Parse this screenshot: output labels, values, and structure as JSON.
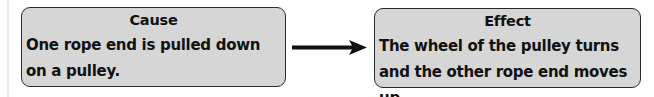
{
  "diagram": {
    "type": "cause-effect",
    "cause": {
      "title": "Cause",
      "text": "One rope end is pulled down on a pulley."
    },
    "effect": {
      "title": "Effect",
      "text": "The wheel of the pulley turns and the other rope end moves up."
    },
    "connector": {
      "icon": "right-arrow-icon",
      "direction": "cause-to-effect"
    },
    "colors": {
      "box_fill": "#d6d6d6",
      "box_border": "#2a2a2a",
      "text": "#111111",
      "arrow": "#111111"
    }
  }
}
